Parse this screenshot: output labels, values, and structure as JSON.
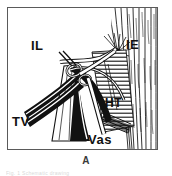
{
  "figure": {
    "caption_letter": "A",
    "cutoff_caption": "Fig. 1 Schematic drawing",
    "panel_border_color": "#5a5a5a",
    "ink_color": "#111111",
    "background_color": "#ffffff",
    "labels": [
      {
        "key": "IL",
        "text": "IL",
        "description": "iliacus-lateral band"
      },
      {
        "key": "IE",
        "text": "IE",
        "description": "iliacus-external fibers"
      },
      {
        "key": "TV",
        "text": "TV",
        "description": "tendon-vessel bundle"
      },
      {
        "key": "HT",
        "text": "HT",
        "description": "hatched tendon region"
      },
      {
        "key": "Vas",
        "text": "Vas",
        "description": "vastus"
      }
    ],
    "icon_names": [
      "anatomical-line-drawing-icon",
      "muscle-fiber-hatching-icon",
      "tendon-band-icon",
      "leader-line-icon"
    ]
  }
}
